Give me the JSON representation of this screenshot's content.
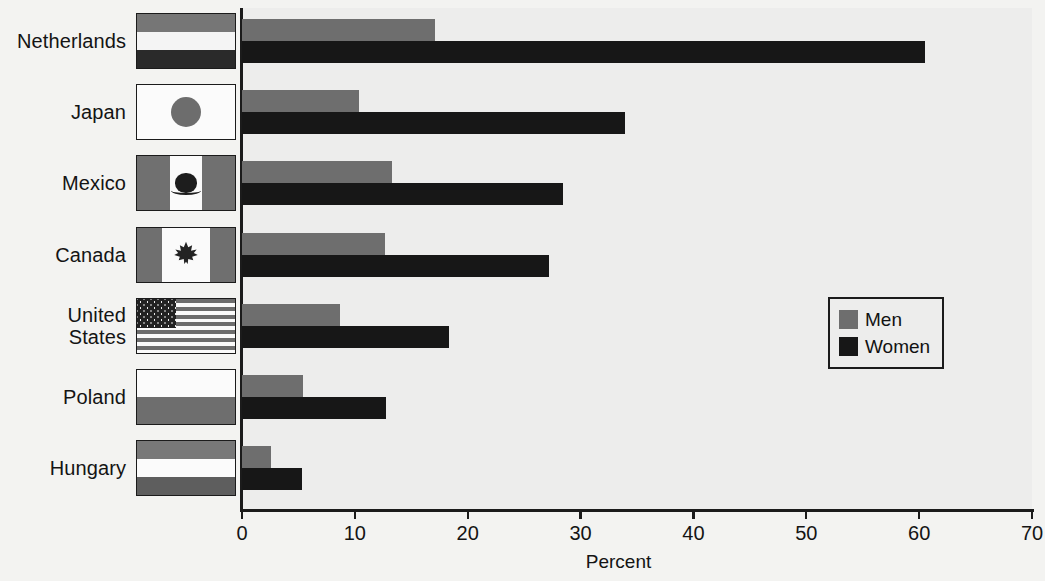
{
  "chart_data": {
    "type": "bar",
    "orientation": "horizontal",
    "title": "",
    "subtitle": "",
    "xlabel": "Percent",
    "ylabel": "",
    "xlim": [
      0,
      70
    ],
    "xticks": [
      0,
      10,
      20,
      30,
      40,
      50,
      60,
      70
    ],
    "grid": false,
    "legend_position": "center-right",
    "categories": [
      "Netherlands",
      "Japan",
      "Mexico",
      "Canada",
      "United States",
      "Poland",
      "Hungary"
    ],
    "category_labels": [
      "Netherlands",
      "Japan",
      "Mexico",
      "Canada",
      "United\nStates",
      "Poland",
      "Hungary"
    ],
    "series": [
      {
        "name": "Men",
        "color": "#6e6e6e",
        "values": [
          17.1,
          10.4,
          13.3,
          12.7,
          8.7,
          5.4,
          2.6
        ]
      },
      {
        "name": "Women",
        "color": "#171717",
        "values": [
          60.5,
          33.9,
          28.4,
          27.2,
          18.3,
          12.8,
          5.3
        ]
      }
    ],
    "flags": [
      "netherlands-flag",
      "japan-flag",
      "mexico-flag",
      "canada-flag",
      "united-states-flag",
      "poland-flag",
      "hungary-flag"
    ]
  },
  "legend": {
    "entries": [
      {
        "label": "Men",
        "color": "#6e6e6e"
      },
      {
        "label": "Women",
        "color": "#171717"
      }
    ]
  },
  "colors": {
    "plot_background": "#ededec",
    "page_background": "#f3f3f1",
    "axis": "#1b1b1b",
    "men_bar": "#6e6e6e",
    "women_bar": "#171717"
  }
}
